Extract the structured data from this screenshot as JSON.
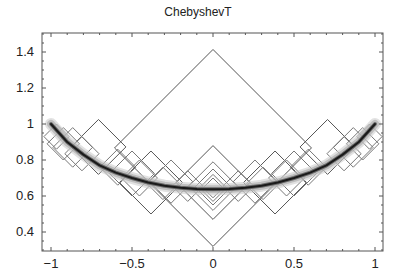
{
  "chart_data": {
    "type": "line",
    "title": "ChebyshevT",
    "xlabel": "",
    "ylabel": "",
    "xlim": [
      -1.05,
      1.05
    ],
    "ylim": [
      0.3,
      1.5
    ],
    "grid": false,
    "legend": null,
    "x_ticks": [
      {
        "value": -1,
        "label": "−1"
      },
      {
        "value": -0.5,
        "label": "−0.5"
      },
      {
        "value": 0,
        "label": "0"
      },
      {
        "value": 0.5,
        "label": "0.5"
      },
      {
        "value": 1,
        "label": "1"
      }
    ],
    "y_ticks": [
      {
        "value": 0.4,
        "label": "0.4"
      },
      {
        "value": 0.6,
        "label": "0.6"
      },
      {
        "value": 0.8,
        "label": "0.8"
      },
      {
        "value": 1.0,
        "label": "1"
      },
      {
        "value": 1.2,
        "label": "1.2"
      },
      {
        "value": 1.4,
        "label": "1.4"
      }
    ],
    "limit_curve": {
      "name": "limit",
      "x": [
        -1,
        -0.9,
        -0.8,
        -0.7,
        -0.6,
        -0.5,
        -0.4,
        -0.3,
        -0.2,
        -0.1,
        0,
        0.1,
        0.2,
        0.3,
        0.4,
        0.5,
        0.6,
        0.7,
        0.8,
        0.9,
        1
      ],
      "y": [
        1.0,
        0.9,
        0.83,
        0.77,
        0.73,
        0.7,
        0.675,
        0.657,
        0.646,
        0.639,
        0.637,
        0.639,
        0.646,
        0.657,
        0.675,
        0.7,
        0.73,
        0.77,
        0.83,
        0.9,
        1.0
      ]
    },
    "diamonds": [
      {
        "cx": 0,
        "top": 1.414,
        "bottom": 0.32
      },
      {
        "cx": 0,
        "top": 0.88,
        "bottom": 0.47
      },
      {
        "cx": 0,
        "top": 0.79,
        "bottom": 0.52
      },
      {
        "cx": 0,
        "top": 0.75,
        "bottom": 0.55
      },
      {
        "cx": 0,
        "top": 0.72,
        "bottom": 0.57
      },
      {
        "cx": 0,
        "top": 0.7,
        "bottom": 0.59
      },
      {
        "cx": -0.707,
        "top": 1.025,
        "bottom": 0.72
      },
      {
        "cx": 0.707,
        "top": 1.025,
        "bottom": 0.72
      },
      {
        "cx": -0.383,
        "top": 0.85,
        "bottom": 0.5
      },
      {
        "cx": 0.383,
        "top": 0.85,
        "bottom": 0.5
      },
      {
        "cx": -0.924,
        "top": 0.98,
        "bottom": 0.8
      },
      {
        "cx": 0.924,
        "top": 0.98,
        "bottom": 0.8
      },
      {
        "cx": -0.866,
        "top": 0.98,
        "bottom": 0.76
      },
      {
        "cx": 0.866,
        "top": 0.98,
        "bottom": 0.76
      },
      {
        "cx": -0.5,
        "top": 0.85,
        "bottom": 0.6
      },
      {
        "cx": 0.5,
        "top": 0.85,
        "bottom": 0.6
      },
      {
        "cx": -0.259,
        "top": 0.8,
        "bottom": 0.56
      },
      {
        "cx": 0.259,
        "top": 0.8,
        "bottom": 0.56
      },
      {
        "cx": -0.588,
        "top": 0.86,
        "bottom": 0.66
      },
      {
        "cx": 0.588,
        "top": 0.86,
        "bottom": 0.66
      },
      {
        "cx": -0.809,
        "top": 0.93,
        "bottom": 0.74
      },
      {
        "cx": 0.809,
        "top": 0.93,
        "bottom": 0.74
      },
      {
        "cx": -0.309,
        "top": 0.76,
        "bottom": 0.58
      },
      {
        "cx": 0.309,
        "top": 0.76,
        "bottom": 0.58
      },
      {
        "cx": -0.156,
        "top": 0.74,
        "bottom": 0.57
      },
      {
        "cx": 0.156,
        "top": 0.74,
        "bottom": 0.57
      },
      {
        "cx": -0.454,
        "top": 0.8,
        "bottom": 0.6
      },
      {
        "cx": 0.454,
        "top": 0.8,
        "bottom": 0.6
      },
      {
        "cx": -0.966,
        "top": 1.0,
        "bottom": 0.86
      },
      {
        "cx": 0.966,
        "top": 1.0,
        "bottom": 0.86
      }
    ]
  }
}
